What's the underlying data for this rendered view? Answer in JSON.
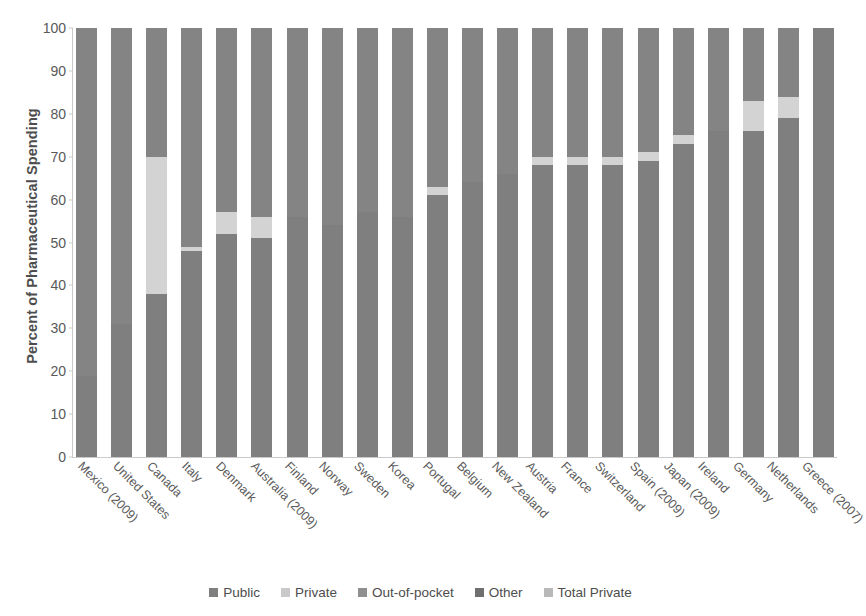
{
  "chart_data": {
    "type": "bar",
    "subtype": "stacked-bar-100",
    "title": "",
    "xlabel": "",
    "ylabel": "Percent of Pharmaceutical Spending",
    "ylim": [
      0,
      100
    ],
    "yticks": [
      0,
      10,
      20,
      30,
      40,
      50,
      60,
      70,
      80,
      90,
      100
    ],
    "grid": false,
    "legend_position": "bottom",
    "categories": [
      "Mexico (2009)",
      "United States",
      "Canada",
      "Italy",
      "Denmark",
      "Australia (2009)",
      "Finland",
      "Norway",
      "Sweden",
      "Korea",
      "Portugal",
      "Belgium",
      "New Zealand",
      "Austria",
      "France",
      "Switzerland",
      "Spain (2009)",
      "Japan (2009)",
      "Ireland",
      "Germany",
      "Netherlands",
      "Greece (2007)"
    ],
    "series": [
      {
        "name": "Public",
        "color": "#7f7f7f",
        "values": [
          19,
          31,
          38,
          48,
          52,
          51,
          56,
          54,
          57,
          56,
          61,
          64,
          66,
          68,
          68,
          68,
          69,
          73,
          76,
          76,
          79,
          100
        ]
      },
      {
        "name": "Private",
        "color": "#c9c9c9",
        "values": [
          0,
          0,
          0,
          0,
          0,
          0,
          0,
          0,
          0,
          0,
          0,
          0,
          0,
          0,
          0,
          0,
          0,
          0,
          0,
          0,
          0,
          0
        ]
      },
      {
        "name": "Out-of-pocket",
        "color": "#959595",
        "values": [
          0,
          0,
          0,
          0,
          0,
          0,
          0,
          0,
          0,
          0,
          0,
          0,
          0,
          0,
          0,
          0,
          0,
          0,
          0,
          0,
          0,
          0
        ]
      },
      {
        "name": "Other",
        "color": "#848484",
        "values": [
          81,
          69,
          30,
          51,
          43,
          44,
          44,
          46,
          43,
          44,
          37,
          36,
          34,
          30,
          30,
          30,
          29,
          25,
          24,
          17,
          16,
          0
        ]
      },
      {
        "name": "Total Private",
        "color": "#d3d3d3",
        "values": [
          0,
          0,
          32,
          1,
          5,
          5,
          0,
          0,
          0,
          0,
          2,
          0,
          0,
          2,
          2,
          2,
          2,
          2,
          0,
          7,
          5,
          0
        ]
      }
    ],
    "stack_order": [
      "Public",
      "Total Private",
      "Other"
    ],
    "legend": [
      {
        "label": "Public",
        "color": "#7f7f7f"
      },
      {
        "label": "Private",
        "color": "#c9c9c9"
      },
      {
        "label": "Out-of-pocket",
        "color": "#8f8f8f"
      },
      {
        "label": "Other",
        "color": "#6f6f6f"
      },
      {
        "label": "Total Private",
        "color": "#b9b9b9"
      }
    ]
  }
}
